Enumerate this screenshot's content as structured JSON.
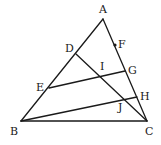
{
  "diagram": {
    "type": "geometry-triangle",
    "points": {
      "A": {
        "x": 103,
        "y": 19
      },
      "B": {
        "x": 21,
        "y": 121
      },
      "C": {
        "x": 147,
        "y": 121
      },
      "D": {
        "x": 76,
        "y": 54
      },
      "E": {
        "x": 49,
        "y": 88
      },
      "F": {
        "x": 115,
        "y": 45
      },
      "G": {
        "x": 125,
        "y": 71
      },
      "H": {
        "x": 137,
        "y": 97
      },
      "I": {
        "x": 101,
        "y": 77
      },
      "J": {
        "x": 124,
        "y": 99
      }
    },
    "labels": [
      {
        "text": "A",
        "x": 99,
        "y": 13
      },
      {
        "text": "B",
        "x": 10,
        "y": 135
      },
      {
        "text": "C",
        "x": 145,
        "y": 135
      },
      {
        "text": "D",
        "x": 65,
        "y": 52
      },
      {
        "text": "E",
        "x": 36,
        "y": 91
      },
      {
        "text": "F",
        "x": 118,
        "y": 48
      },
      {
        "text": "G",
        "x": 128,
        "y": 74
      },
      {
        "text": "H",
        "x": 140,
        "y": 100
      },
      {
        "text": "I",
        "x": 100,
        "y": 70
      },
      {
        "text": "J",
        "x": 118,
        "y": 111
      }
    ],
    "segments": [
      [
        "A",
        "B"
      ],
      [
        "A",
        "C"
      ],
      [
        "B",
        "C"
      ],
      [
        "D",
        "C"
      ],
      [
        "E",
        "G"
      ],
      [
        "B",
        "H"
      ]
    ],
    "marked_points": [
      "F"
    ]
  }
}
